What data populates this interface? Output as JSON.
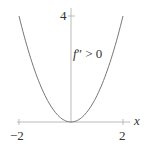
{
  "chart_data": {
    "type": "line",
    "title": "",
    "function": "f(x) = x^2",
    "xlabel": "x",
    "ylabel": "",
    "xlim": [
      -2,
      2
    ],
    "ylim": [
      0,
      4
    ],
    "x_ticks": [
      "-2",
      "2"
    ],
    "y_ticks": [
      "4"
    ],
    "annotation": "f'' > 0",
    "grid": false,
    "series": [
      {
        "name": "f(x)",
        "x": [
          -2,
          -1.5,
          -1,
          -0.5,
          0,
          0.5,
          1,
          1.5,
          2
        ],
        "values": [
          4,
          2.25,
          1,
          0.25,
          0,
          0.25,
          1,
          2.25,
          4
        ]
      }
    ]
  },
  "labels": {
    "x_axis": "x",
    "x_tick_neg": "−2",
    "x_tick_pos": "2",
    "y_tick": "4",
    "annotation_f": "f",
    "annotation_rest": "″ > 0"
  },
  "colors": {
    "curve": "#777777",
    "axis": "#bbbbbb"
  }
}
